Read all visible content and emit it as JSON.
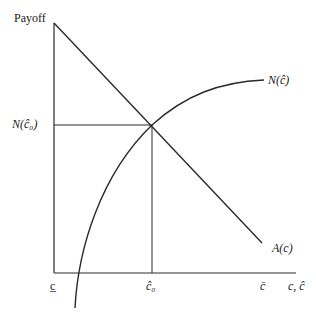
{
  "diagram": {
    "y_axis_label": "Payoff",
    "x_axis_label": "c, ĉ",
    "y_tick_label": "N(ĉ₀)",
    "x_ticks": [
      "c̲",
      "ĉ₀",
      "c̄"
    ],
    "curves": [
      {
        "name": "A(c)",
        "shape": "decreasing line"
      },
      {
        "name": "N(ĉ)",
        "shape": "increasing concave curve"
      }
    ],
    "colors": {
      "line": "#2a2a2a",
      "background": "#ffffff"
    }
  }
}
